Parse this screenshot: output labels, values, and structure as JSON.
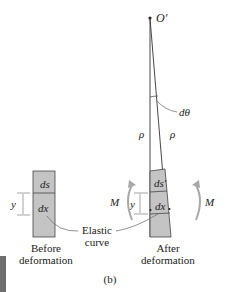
{
  "figure": {
    "label": "(b)",
    "origin_label": "O′",
    "angle_label": "dθ",
    "radius_label_left": "ρ",
    "radius_label_right": "ρ",
    "moment_label_left": "M",
    "moment_label_right": "M",
    "before": {
      "top_label": "ds",
      "bottom_label": "dx",
      "y_label": "y",
      "caption_line1": "Before",
      "caption_line2": "deformation"
    },
    "after": {
      "top_label": "ds′",
      "bottom_label": "dx",
      "y_label": "y",
      "caption_line1": "After",
      "caption_line2": "deformation"
    },
    "elastic_curve_line1": "Elastic",
    "elastic_curve_line2": "curve",
    "colors": {
      "element_fill": "#c4c4c4",
      "line": "#333333",
      "arrow": "#a8a8a8",
      "tab": "#6e6e6e"
    }
  }
}
